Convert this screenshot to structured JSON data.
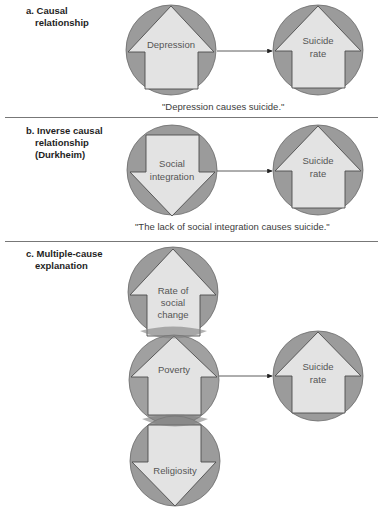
{
  "colors": {
    "circle_fill": "#9b9b9b",
    "circle_stroke": "#6a6a6a",
    "arrow_fill": "#e3e3e3",
    "arrow_stroke": "#4d4d4d",
    "connector": "#333333",
    "separator": "#777777"
  },
  "sections": [
    {
      "id": "a",
      "label_lines": [
        "a. Causal",
        "relationship"
      ],
      "cause": {
        "text": [
          "Depression"
        ],
        "direction": "up"
      },
      "effect": {
        "text": [
          "Suicide",
          "rate"
        ],
        "direction": "up"
      },
      "caption": "\"Depression causes suicide.\""
    },
    {
      "id": "b",
      "label_lines": [
        "b. Inverse causal",
        "relationship",
        "(Durkheim)"
      ],
      "cause": {
        "text": [
          "Social",
          "integration"
        ],
        "direction": "down"
      },
      "effect": {
        "text": [
          "Suicide",
          "rate"
        ],
        "direction": "up"
      },
      "caption": "\"The lack of social integration causes suicide.\""
    },
    {
      "id": "c",
      "label_lines": [
        "c. Multiple-cause",
        "explanation"
      ],
      "causes": [
        {
          "text": [
            "Rate of",
            "social",
            "change"
          ],
          "direction": "up"
        },
        {
          "text": [
            "Poverty"
          ],
          "direction": "up"
        },
        {
          "text": [
            "Religiosity"
          ],
          "direction": "down"
        }
      ],
      "effect": {
        "text": [
          "Suicide",
          "rate"
        ],
        "direction": "up"
      }
    }
  ]
}
